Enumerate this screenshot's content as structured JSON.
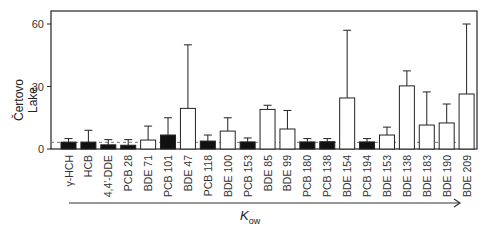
{
  "chart_data": {
    "type": "bar",
    "title": "",
    "ylabel": "Čertovo Lake",
    "xlabel_main": "K",
    "xlabel_sub": "ow",
    "ylim": [
      0,
      66
    ],
    "yticks": [
      0,
      30,
      60
    ],
    "grid": false,
    "reference_line": {
      "value": 3.2,
      "style": "dashed"
    },
    "categories": [
      "γ-HCH",
      "HCB",
      "4,4'-DDE",
      "PCB 28",
      "BDE 71",
      "PCB 101",
      "BDE 47",
      "PCB 118",
      "BDE 100",
      "PCB 153",
      "BDE 85",
      "BDE 99",
      "PCB 180",
      "PCB 138",
      "BDE 154",
      "PCB 194",
      "BDE 153",
      "BDE 138",
      "BDE 183",
      "BDE 190",
      "BDE 209"
    ],
    "values": [
      3.3,
      3.3,
      2.0,
      1.8,
      4.3,
      6.7,
      19.5,
      3.8,
      8.6,
      3.4,
      19.0,
      9.6,
      3.4,
      3.5,
      24.5,
      3.4,
      6.7,
      30.3,
      11.5,
      12.5,
      26.4
    ],
    "error_upper": [
      5.0,
      9.0,
      4.5,
      4.5,
      11.0,
      15.0,
      50.0,
      6.7,
      15.0,
      5.3,
      21.0,
      18.5,
      5.0,
      5.0,
      57.0,
      5.0,
      10.5,
      37.5,
      27.4,
      21.6,
      60.0
    ],
    "fill": [
      "black",
      "black",
      "black",
      "black",
      "white",
      "black",
      "white",
      "black",
      "white",
      "black",
      "white",
      "white",
      "black",
      "black",
      "white",
      "black",
      "white",
      "white",
      "white",
      "white",
      "white"
    ],
    "arrow": "increasing K_ow"
  },
  "colors": {
    "filled": "#111111",
    "open": "#ffffff",
    "stroke": "#222222",
    "dashed": "#777777"
  }
}
